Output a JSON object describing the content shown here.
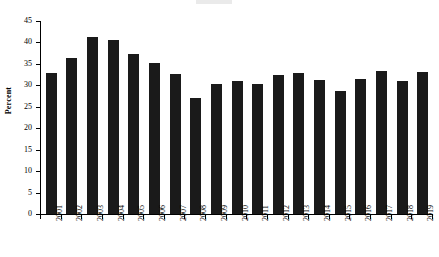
{
  "chart_data": {
    "type": "bar",
    "title": "",
    "xlabel": "",
    "ylabel": "Percent",
    "ylim": [
      0,
      45
    ],
    "yticks": [
      0,
      5,
      10,
      15,
      20,
      25,
      30,
      35,
      40,
      45
    ],
    "grid": false,
    "legend": false,
    "bar_color": "#1a1a1a",
    "categories": [
      "2001",
      "2002",
      "2003",
      "2004",
      "2005",
      "2006",
      "2007",
      "2008",
      "2009",
      "2010",
      "2011",
      "2012",
      "2013",
      "2014",
      "2015",
      "2016",
      "2017",
      "2018",
      "2019"
    ],
    "values": [
      32.9,
      36.3,
      41.2,
      40.5,
      37.2,
      35.1,
      32.7,
      27.0,
      30.2,
      30.9,
      30.4,
      32.3,
      32.8,
      31.3,
      28.7,
      31.5,
      33.4,
      31.0,
      33.0
    ],
    "series": [
      {
        "name": "Percent",
        "values": [
          32.9,
          36.3,
          41.2,
          40.5,
          37.2,
          35.1,
          32.7,
          27.0,
          30.2,
          30.9,
          30.4,
          32.3,
          32.8,
          31.3,
          28.7,
          31.5,
          33.4,
          31.0,
          33.0
        ]
      }
    ]
  },
  "axes": {
    "y_label": "Percent",
    "y_tick_labels": [
      "45",
      "40",
      "35",
      "30",
      "25",
      "20",
      "15",
      "10",
      "5",
      "0"
    ],
    "x_tick_labels": [
      "2001",
      "2002",
      "2003",
      "2004",
      "2005",
      "2006",
      "2007",
      "2008",
      "2009",
      "2010",
      "2011",
      "2012",
      "2013",
      "2014",
      "2015",
      "2016",
      "2017",
      "2018",
      "2019"
    ]
  }
}
